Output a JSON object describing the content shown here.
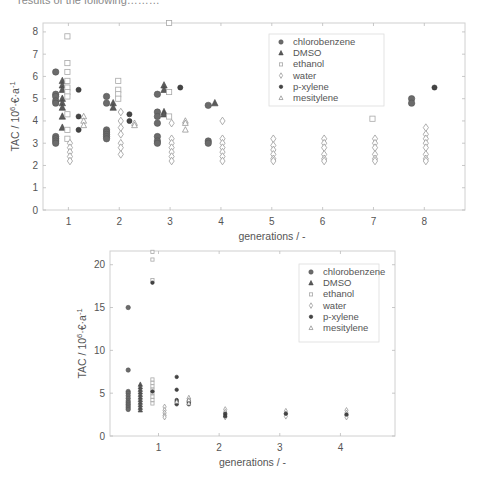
{
  "caption_fragment": "results of the following………",
  "chart_data": [
    {
      "type": "scatter",
      "title": "",
      "xlabel": "generations / -",
      "ylabel": "TAC / 10^6 €·a^-1",
      "xlim": [
        0.5,
        8.8
      ],
      "ylim": [
        0,
        8.4
      ],
      "xticks": [
        1,
        2,
        3,
        4,
        5,
        6,
        7,
        8
      ],
      "yticks": [
        0,
        1,
        2,
        3,
        4,
        5,
        6,
        7,
        8
      ],
      "grid": false,
      "legend_position": "upper right",
      "legend": [
        "chlorobenzene",
        "DMSO",
        "ethanol",
        "water",
        "p-xylene",
        "mesitylene"
      ],
      "series": [
        {
          "name": "chlorobenzene",
          "marker": "circle",
          "offset": -0.25,
          "points": [
            [
              1,
              6.2
            ],
            [
              1,
              5.2
            ],
            [
              1,
              5.1
            ],
            [
              1,
              4.9
            ],
            [
              1,
              4.8
            ],
            [
              1,
              3.3
            ],
            [
              1,
              3.2
            ],
            [
              1,
              3.1
            ],
            [
              1,
              3.0
            ],
            [
              2,
              5.1
            ],
            [
              2,
              4.8
            ],
            [
              2,
              3.6
            ],
            [
              2,
              3.5
            ],
            [
              2,
              3.4
            ],
            [
              2,
              3.3
            ],
            [
              2,
              3.2
            ],
            [
              3,
              5.2
            ],
            [
              3,
              4.4
            ],
            [
              3,
              4.2
            ],
            [
              3,
              3.9
            ],
            [
              3,
              3.3
            ],
            [
              3,
              3.1
            ],
            [
              3,
              3.0
            ],
            [
              4,
              4.7
            ],
            [
              4,
              3.1
            ],
            [
              4,
              3.0
            ],
            [
              8,
              5.0
            ],
            [
              8,
              4.8
            ]
          ]
        },
        {
          "name": "DMSO",
          "marker": "triangle",
          "offset": -0.12,
          "points": [
            [
              1,
              5.8
            ],
            [
              1,
              5.6
            ],
            [
              1,
              5.4
            ],
            [
              1,
              5.0
            ],
            [
              1,
              4.8
            ],
            [
              1,
              4.6
            ],
            [
              1,
              4.2
            ],
            [
              1,
              3.7
            ],
            [
              2,
              4.8
            ],
            [
              2,
              4.6
            ],
            [
              3,
              5.6
            ],
            [
              3,
              5.4
            ],
            [
              3,
              4.4
            ],
            [
              3,
              4.3
            ],
            [
              4,
              4.8
            ]
          ]
        },
        {
          "name": "ethanol",
          "marker": "square",
          "offset": -0.02,
          "points": [
            [
              1,
              7.8
            ],
            [
              1,
              6.6
            ],
            [
              1,
              6.2
            ],
            [
              1,
              5.8
            ],
            [
              1,
              5.5
            ],
            [
              1,
              5.3
            ],
            [
              1,
              5.1
            ],
            [
              1,
              4.3
            ],
            [
              1,
              3.6
            ],
            [
              1,
              3.2
            ],
            [
              2,
              5.8
            ],
            [
              2,
              5.4
            ],
            [
              2,
              5.2
            ],
            [
              2,
              5.0
            ],
            [
              3,
              8.4
            ],
            [
              3,
              5.3
            ],
            [
              3,
              4.2
            ],
            [
              7,
              4.1
            ]
          ]
        },
        {
          "name": "water",
          "marker": "diamond",
          "offset": 0.03,
          "points": [
            [
              1,
              3.0
            ],
            [
              1,
              2.8
            ],
            [
              1,
              2.6
            ],
            [
              1,
              2.4
            ],
            [
              1,
              2.2
            ],
            [
              2,
              4.4
            ],
            [
              2,
              4.0
            ],
            [
              2,
              3.7
            ],
            [
              2,
              3.4
            ],
            [
              2,
              3.0
            ],
            [
              2,
              2.8
            ],
            [
              2,
              2.5
            ],
            [
              3,
              3.9
            ],
            [
              3,
              3.2
            ],
            [
              3,
              3.0
            ],
            [
              3,
              2.8
            ],
            [
              3,
              2.6
            ],
            [
              3,
              2.4
            ],
            [
              3,
              2.2
            ],
            [
              4,
              4.0
            ],
            [
              4,
              3.2
            ],
            [
              4,
              3.0
            ],
            [
              4,
              2.8
            ],
            [
              4,
              2.6
            ],
            [
              4,
              2.4
            ],
            [
              4,
              2.2
            ],
            [
              5,
              3.2
            ],
            [
              5,
              2.9
            ],
            [
              5,
              2.7
            ],
            [
              5,
              2.5
            ],
            [
              5,
              2.3
            ],
            [
              5,
              2.2
            ],
            [
              6,
              3.2
            ],
            [
              6,
              3.0
            ],
            [
              6,
              2.8
            ],
            [
              6,
              2.5
            ],
            [
              6,
              2.3
            ],
            [
              6,
              2.2
            ],
            [
              7,
              3.2
            ],
            [
              7,
              3.0
            ],
            [
              7,
              2.8
            ],
            [
              7,
              2.5
            ],
            [
              7,
              2.3
            ],
            [
              7,
              2.2
            ],
            [
              8,
              3.7
            ],
            [
              8,
              3.4
            ],
            [
              8,
              3.2
            ],
            [
              8,
              3.0
            ],
            [
              8,
              2.8
            ],
            [
              8,
              2.5
            ],
            [
              8,
              2.3
            ],
            [
              8,
              2.2
            ]
          ]
        },
        {
          "name": "p-xylene",
          "marker": "dot",
          "offset": 0.2,
          "points": [
            [
              1,
              5.4
            ],
            [
              1,
              4.2
            ],
            [
              1,
              3.6
            ],
            [
              2,
              4.3
            ],
            [
              2,
              4.0
            ],
            [
              3,
              5.5
            ],
            [
              8,
              5.5
            ]
          ]
        },
        {
          "name": "mesitylene",
          "marker": "star",
          "offset": 0.3,
          "points": [
            [
              1,
              4.2
            ],
            [
              1,
              4.0
            ],
            [
              1,
              3.8
            ],
            [
              2,
              3.9
            ],
            [
              2,
              3.8
            ],
            [
              3,
              4.0
            ],
            [
              3,
              3.9
            ],
            [
              3,
              3.6
            ]
          ]
        }
      ]
    },
    {
      "type": "scatter",
      "title": "",
      "xlabel": "generations / -",
      "ylabel": "TAC / 10^6 €·a^-1",
      "xlim": [
        0.2,
        4.9
      ],
      "ylim": [
        0,
        21.6
      ],
      "xticks": [
        1,
        2,
        3,
        4
      ],
      "yticks": [
        0,
        5,
        10,
        15,
        20
      ],
      "grid": false,
      "legend_position": "upper right",
      "legend": [
        "chlorobenzene",
        "DMSO",
        "ethanol",
        "water",
        "p-xylene",
        "mesitylene"
      ],
      "series": [
        {
          "name": "chlorobenzene",
          "marker": "circle",
          "x": 0.5,
          "points": [
            [
              0.5,
              15.0
            ],
            [
              0.5,
              7.7
            ],
            [
              0.5,
              5.2
            ],
            [
              0.5,
              5.0
            ],
            [
              0.5,
              4.7
            ],
            [
              0.5,
              4.4
            ],
            [
              0.5,
              4.1
            ],
            [
              0.5,
              3.9
            ],
            [
              0.5,
              3.7
            ],
            [
              0.5,
              3.5
            ],
            [
              0.5,
              3.3
            ],
            [
              0.5,
              3.1
            ]
          ]
        },
        {
          "name": "DMSO",
          "marker": "triangle",
          "points": [
            [
              0.7,
              6.0
            ],
            [
              0.7,
              5.7
            ],
            [
              0.7,
              5.4
            ],
            [
              0.7,
              5.1
            ],
            [
              0.7,
              4.8
            ],
            [
              0.7,
              4.5
            ],
            [
              0.7,
              4.2
            ],
            [
              0.7,
              3.9
            ],
            [
              0.7,
              3.6
            ],
            [
              0.7,
              3.3
            ],
            [
              0.7,
              3.0
            ]
          ]
        },
        {
          "name": "ethanol",
          "marker": "square",
          "points": [
            [
              0.9,
              21.5
            ],
            [
              0.9,
              20.6
            ],
            [
              0.9,
              18.2
            ],
            [
              0.9,
              6.6
            ],
            [
              0.9,
              6.2
            ],
            [
              0.9,
              5.8
            ],
            [
              0.9,
              5.4
            ],
            [
              0.9,
              5.0
            ],
            [
              0.9,
              4.6
            ],
            [
              0.9,
              4.2
            ],
            [
              0.9,
              3.8
            ]
          ]
        },
        {
          "name": "water",
          "marker": "diamond",
          "points": [
            [
              1.1,
              3.4
            ],
            [
              1.1,
              3.0
            ],
            [
              1.1,
              2.7
            ],
            [
              1.1,
              2.4
            ],
            [
              1.1,
              2.2
            ],
            [
              2.1,
              3.1
            ],
            [
              2.1,
              2.8
            ],
            [
              2.1,
              2.5
            ],
            [
              2.1,
              2.2
            ],
            [
              3.1,
              2.9
            ],
            [
              3.1,
              2.6
            ],
            [
              3.1,
              2.3
            ],
            [
              4.1,
              3.0
            ],
            [
              4.1,
              2.7
            ],
            [
              4.1,
              2.4
            ],
            [
              4.1,
              2.2
            ]
          ]
        },
        {
          "name": "p-xylene",
          "marker": "dot",
          "points": [
            [
              0.9,
              17.9
            ],
            [
              0.9,
              5.2
            ],
            [
              1.3,
              6.9
            ],
            [
              1.3,
              5.4
            ],
            [
              1.3,
              4.2
            ],
            [
              1.3,
              4.0
            ],
            [
              1.3,
              3.7
            ],
            [
              1.5,
              4.1
            ],
            [
              1.5,
              3.9
            ],
            [
              1.5,
              3.7
            ],
            [
              2.1,
              2.6
            ],
            [
              2.1,
              2.3
            ],
            [
              3.1,
              2.6
            ],
            [
              4.1,
              2.5
            ]
          ]
        },
        {
          "name": "mesitylene",
          "marker": "star",
          "points": [
            [
              1.5,
              4.5
            ],
            [
              1.5,
              4.2
            ],
            [
              1.5,
              3.8
            ],
            [
              1.3,
              4.0
            ]
          ]
        }
      ]
    }
  ]
}
